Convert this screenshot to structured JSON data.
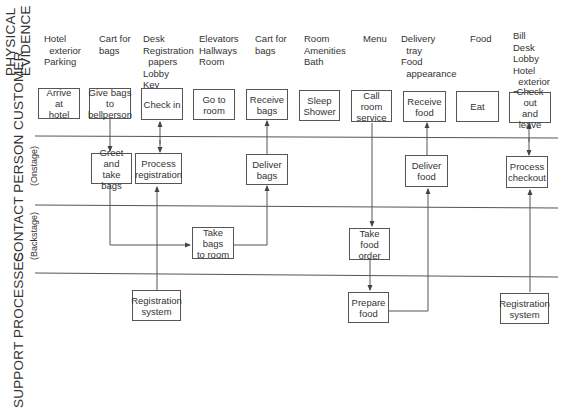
{
  "lanes": {
    "physical_evidence": [
      "PHYSICAL",
      "EVIDENCE"
    ],
    "customer": "CUSTOMER",
    "contact_person": "CONTACT PERSON",
    "onstage": "(Onstage)",
    "backstage": "(Backstage)",
    "support_processes": "SUPPORT  PROCESSES"
  },
  "physical_evidence": [
    {
      "text": "Hotel\n  exterior\nParking"
    },
    {
      "text": "Cart for\nbags"
    },
    {
      "text": "Desk\nRegistration\n  papers\nLobby\nKey"
    },
    {
      "text": "Elevators\nHallways\nRoom"
    },
    {
      "text": "Cart for\nbags"
    },
    {
      "text": "Room\nAmenities\nBath"
    },
    {
      "text": "Menu"
    },
    {
      "text": "Delivery\n  tray\nFood\n  appearance"
    },
    {
      "text": "Food"
    },
    {
      "text": "Bill\nDesk\nLobby\nHotel\n  exterior\nParking"
    }
  ],
  "customer_actions": [
    {
      "label": "Arrive\nat\nhotel"
    },
    {
      "label": "Give bags\nto\nbellperson"
    },
    {
      "label": "Check in"
    },
    {
      "label": "Go to\nroom"
    },
    {
      "label": "Receive\nbags"
    },
    {
      "label": "Sleep\nShower"
    },
    {
      "label": "Call\nroom\nservice"
    },
    {
      "label": "Receive\nfood"
    },
    {
      "label": "Eat"
    },
    {
      "label": "Check out\nand\nleave"
    }
  ],
  "onstage_actions": [
    {
      "label": "Greet and\ntake\nbags"
    },
    {
      "label": "Process\nregistration"
    },
    {
      "label": "Deliver\nbags"
    },
    {
      "label": "Deliver\nfood"
    },
    {
      "label": "Process\ncheckout"
    }
  ],
  "backstage_actions": [
    {
      "label": "Take bags\nto room"
    },
    {
      "label": "Take\nfood\norder"
    }
  ],
  "support_actions": [
    {
      "label": "Registration\nsystem"
    },
    {
      "label": "Prepare\nfood"
    },
    {
      "label": "Registration\nsystem"
    }
  ],
  "colors": {
    "line": "#555555",
    "text": "#333333",
    "background": "#ffffff"
  }
}
